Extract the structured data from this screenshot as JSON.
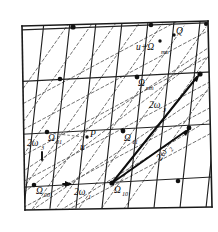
{
  "figure": {
    "background_color": "#ffffff",
    "line_color": "#222222",
    "dashed_color": "#5a5a5a",
    "arrow_color": "#0d0d0d",
    "width": 218,
    "height": 232
  },
  "labels": {
    "omega_00": {
      "base": "Ω",
      "sub": "00"
    },
    "omega_01": {
      "base": "Ω",
      "sub": "01"
    },
    "omega_10": {
      "base": "Ω",
      "sub": "10"
    },
    "omega_11": {
      "base": "Ω",
      "sub": "11"
    },
    "omega_mn": {
      "base": "Ω",
      "sub": "mn"
    },
    "u_plus_omega_mn": {
      "prefix": "u+Ω",
      "sub": "mn"
    },
    "point_p": "P",
    "point_q": "Q",
    "vector_u": "u",
    "two_omega_1": {
      "base": "2ω",
      "sub": "1"
    },
    "two_omega_2": {
      "base": "2ω",
      "sub": "2"
    },
    "two_omega_3": {
      "base": "2ω",
      "sub": "3"
    }
  },
  "nodes": [
    {
      "name": "omega_00",
      "x": 34,
      "y": 185
    },
    {
      "name": "omega_01",
      "x": 47,
      "y": 132
    },
    {
      "name": "omega_10",
      "x": 112,
      "y": 183
    },
    {
      "name": "omega_11",
      "x": 123,
      "y": 131
    },
    {
      "name": "omega_mn",
      "x": 137,
      "y": 76
    },
    {
      "name": "node-top-left",
      "x": 60,
      "y": 78
    },
    {
      "name": "node-top-upper",
      "x": 72,
      "y": 26
    },
    {
      "name": "node-mid-upper",
      "x": 150,
      "y": 25
    },
    {
      "name": "node-right-mid",
      "x": 199,
      "y": 74
    },
    {
      "name": "node-right-lower",
      "x": 188,
      "y": 128
    },
    {
      "name": "node-bottom-right",
      "x": 178,
      "y": 181
    }
  ],
  "points": [
    {
      "name": "point-p",
      "x": 87,
      "y": 137
    },
    {
      "name": "point-q",
      "x": 178,
      "y": 34
    },
    {
      "name": "point-u-plus-omega",
      "x": 160,
      "y": 41
    }
  ],
  "vectors": [
    {
      "name": "two-omega-3-vector",
      "from": "omega_10",
      "to_x": 199,
      "to_y": 74,
      "label": "2ω₃"
    },
    {
      "name": "two-omega-2-vector",
      "from": "omega_10",
      "to_x": 188,
      "to_y": 128,
      "label": "2ω₂"
    }
  ]
}
